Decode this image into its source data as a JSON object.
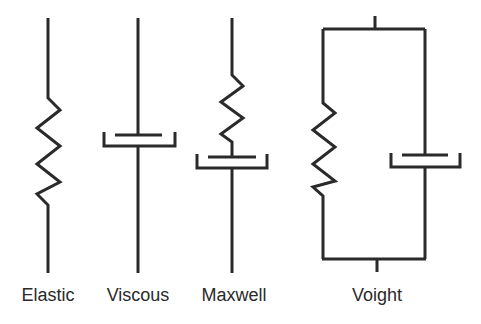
{
  "diagram": {
    "title": "",
    "models": [
      {
        "id": "elastic",
        "label": "Elastic",
        "components": [
          "spring"
        ]
      },
      {
        "id": "viscous",
        "label": "Viscous",
        "components": [
          "dashpot"
        ]
      },
      {
        "id": "maxwell",
        "label": "Maxwell",
        "components": [
          "spring",
          "dashpot"
        ],
        "arrangement": "series"
      },
      {
        "id": "voight",
        "label": "Voight",
        "components": [
          "spring",
          "dashpot"
        ],
        "arrangement": "parallel"
      }
    ],
    "colors": {
      "stroke": "#2a2a2a",
      "background": "#ffffff"
    }
  }
}
